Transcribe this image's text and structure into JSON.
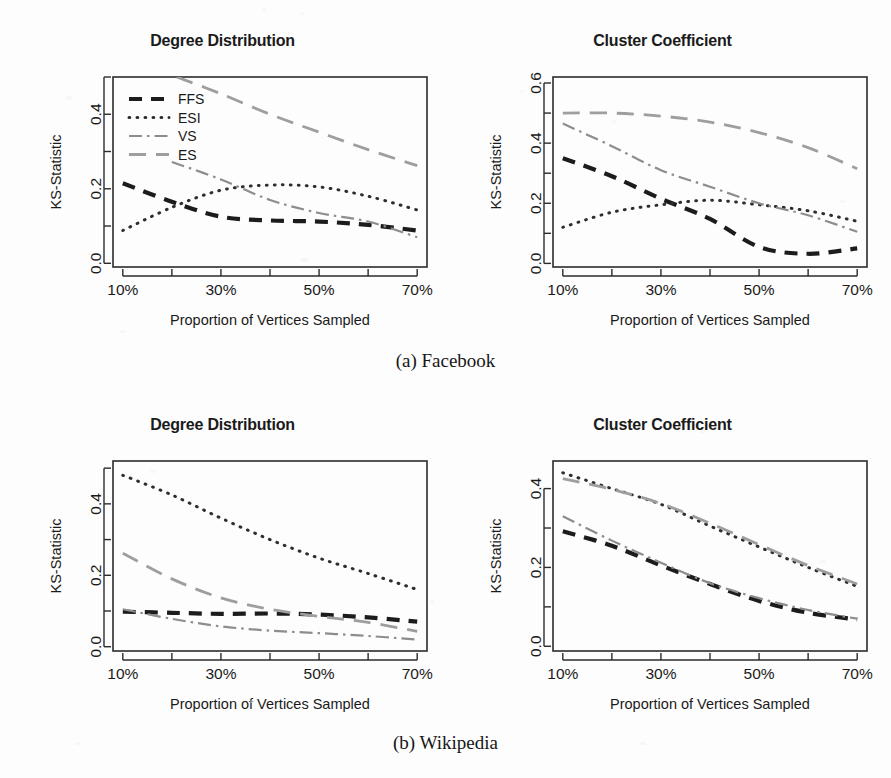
{
  "figure": {
    "captions": [
      {
        "id": "a",
        "text": "(a) Facebook"
      },
      {
        "id": "b",
        "text": "(b) Wikipedia"
      }
    ],
    "axis_title_x": "Proportion of Vertices Sampled",
    "axis_title_y": "KS-Statistic",
    "legend": {
      "entries": [
        {
          "label": "FFS",
          "style": "thick-dash",
          "color": "#1c1c1c"
        },
        {
          "label": "ESI",
          "style": "dotted",
          "color": "#2e2e2e"
        },
        {
          "label": "VS",
          "style": "dash-dot",
          "color": "#8d8d8d"
        },
        {
          "label": "ES",
          "style": "long-dash",
          "color": "#9e9e9e"
        }
      ]
    },
    "colors": {
      "ffs": "#1c1c1c",
      "esi": "#2e2e2e",
      "vs": "#8d8d8d",
      "es": "#9e9e9e",
      "frame": "#2b2b2b",
      "background": "#fdfdfd"
    }
  },
  "chart_data": [
    {
      "id": "facebook-degree-distribution",
      "type": "line",
      "title": "Degree Distribution",
      "dataset": "Facebook",
      "xlabel": "Proportion of Vertices Sampled",
      "ylabel": "KS-Statistic",
      "x": [
        10,
        20,
        30,
        40,
        50,
        60,
        70
      ],
      "xlim": [
        8,
        72
      ],
      "xticks": [
        10,
        20,
        30,
        40,
        50,
        60,
        70
      ],
      "xticklabels": [
        "10%",
        "",
        "30%",
        "",
        "50%",
        "",
        "70%"
      ],
      "ylim": [
        -0.01,
        0.5
      ],
      "yticks": [
        0.0,
        0.1,
        0.2,
        0.3,
        0.4,
        0.5
      ],
      "yticklabels": [
        "0.0",
        "",
        "0.2",
        "",
        "0.4",
        ""
      ],
      "grid": false,
      "legend_position": "top-left",
      "has_legend": true,
      "series": [
        {
          "name": "FFS",
          "style": "thick-dash",
          "color": "#1c1c1c",
          "x": [
            10,
            20,
            30,
            40,
            50,
            60,
            70
          ],
          "values": [
            0.215,
            0.165,
            0.125,
            0.115,
            0.112,
            0.103,
            0.088
          ]
        },
        {
          "name": "ESI",
          "style": "dotted",
          "color": "#2e2e2e",
          "x": [
            10,
            20,
            30,
            40,
            50,
            60,
            70
          ],
          "values": [
            0.088,
            0.15,
            0.196,
            0.21,
            0.205,
            0.18,
            0.143
          ]
        },
        {
          "name": "VS",
          "style": "dash-dot",
          "color": "#8d8d8d",
          "x": [
            20,
            30,
            40,
            50,
            60,
            70
          ],
          "values": [
            0.272,
            0.225,
            0.17,
            0.135,
            0.112,
            0.07
          ]
        },
        {
          "name": "ES",
          "style": "long-dash",
          "color": "#9e9e9e",
          "x": [
            21,
            30,
            40,
            50,
            60,
            70
          ],
          "values": [
            0.5,
            0.455,
            0.4,
            0.352,
            0.305,
            0.262
          ]
        }
      ]
    },
    {
      "id": "facebook-cluster-coefficient",
      "type": "line",
      "title": "Cluster Coefficient",
      "dataset": "Facebook",
      "xlabel": "Proportion of Vertices Sampled",
      "ylabel": "KS-Statistic",
      "x": [
        10,
        20,
        30,
        40,
        50,
        60,
        70
      ],
      "xlim": [
        8,
        72
      ],
      "xticks": [
        10,
        20,
        30,
        40,
        50,
        60,
        70
      ],
      "xticklabels": [
        "10%",
        "",
        "30%",
        "",
        "50%",
        "",
        "70%"
      ],
      "ylim": [
        -0.012,
        0.62
      ],
      "yticks": [
        0.0,
        0.1,
        0.2,
        0.3,
        0.4,
        0.5,
        0.6
      ],
      "yticklabels": [
        "0.0",
        "",
        "0.2",
        "",
        "0.4",
        "",
        "0.6"
      ],
      "grid": false,
      "legend_position": "none",
      "has_legend": false,
      "series": [
        {
          "name": "FFS",
          "style": "thick-dash",
          "color": "#1c1c1c",
          "x": [
            10,
            20,
            30,
            40,
            50,
            60,
            70
          ],
          "values": [
            0.35,
            0.29,
            0.215,
            0.148,
            0.055,
            0.032,
            0.05
          ]
        },
        {
          "name": "ESI",
          "style": "dotted",
          "color": "#2e2e2e",
          "x": [
            10,
            20,
            30,
            40,
            50,
            60,
            70
          ],
          "values": [
            0.12,
            0.17,
            0.195,
            0.21,
            0.195,
            0.175,
            0.14
          ]
        },
        {
          "name": "VS",
          "style": "dash-dot",
          "color": "#8d8d8d",
          "x": [
            10,
            20,
            30,
            40,
            50,
            60,
            70
          ],
          "values": [
            0.465,
            0.39,
            0.31,
            0.255,
            0.2,
            0.16,
            0.105
          ]
        },
        {
          "name": "ES",
          "style": "long-dash",
          "color": "#9e9e9e",
          "x": [
            10,
            20,
            30,
            40,
            50,
            60,
            70
          ],
          "values": [
            0.5,
            0.5,
            0.49,
            0.47,
            0.435,
            0.385,
            0.315
          ]
        }
      ]
    },
    {
      "id": "wikipedia-degree-distribution",
      "type": "line",
      "title": "Degree Distribution",
      "dataset": "Wikipedia",
      "xlabel": "Proportion of Vertices Sampled",
      "ylabel": "KS-Statistic",
      "x": [
        10,
        20,
        30,
        40,
        50,
        60,
        70
      ],
      "xlim": [
        8,
        72
      ],
      "xticks": [
        10,
        20,
        30,
        40,
        50,
        60,
        70
      ],
      "xticklabels": [
        "10%",
        "",
        "30%",
        "",
        "50%",
        "",
        "70%"
      ],
      "ylim": [
        -0.012,
        0.52
      ],
      "yticks": [
        0.0,
        0.1,
        0.2,
        0.3,
        0.4,
        0.5
      ],
      "yticklabels": [
        "0.0",
        "",
        "0.2",
        "",
        "0.4",
        ""
      ],
      "grid": false,
      "legend_position": "none",
      "has_legend": false,
      "series": [
        {
          "name": "FFS",
          "style": "thick-dash",
          "color": "#1c1c1c",
          "x": [
            10,
            20,
            30,
            40,
            50,
            60,
            70
          ],
          "values": [
            0.098,
            0.095,
            0.092,
            0.093,
            0.09,
            0.082,
            0.07
          ]
        },
        {
          "name": "ESI",
          "style": "dotted",
          "color": "#2e2e2e",
          "x": [
            10,
            20,
            30,
            40,
            50,
            60,
            70
          ],
          "values": [
            0.48,
            0.425,
            0.36,
            0.3,
            0.248,
            0.205,
            0.16
          ]
        },
        {
          "name": "VS",
          "style": "dash-dot",
          "color": "#8d8d8d",
          "x": [
            10,
            20,
            30,
            40,
            50,
            60,
            70
          ],
          "values": [
            0.105,
            0.078,
            0.057,
            0.045,
            0.038,
            0.03,
            0.02
          ]
        },
        {
          "name": "ES",
          "style": "long-dash",
          "color": "#9e9e9e",
          "x": [
            10,
            20,
            30,
            40,
            50,
            60,
            70
          ],
          "values": [
            0.262,
            0.19,
            0.137,
            0.105,
            0.085,
            0.068,
            0.043
          ]
        }
      ]
    },
    {
      "id": "wikipedia-cluster-coefficient",
      "type": "line",
      "title": "Cluster Coefficient",
      "dataset": "Wikipedia",
      "xlabel": "Proportion of Vertices Sampled",
      "ylabel": "KS-Statistic",
      "x": [
        10,
        20,
        30,
        40,
        50,
        60,
        70
      ],
      "xlim": [
        8,
        72
      ],
      "xticks": [
        10,
        20,
        30,
        40,
        50,
        60,
        70
      ],
      "xticklabels": [
        "10%",
        "",
        "30%",
        "",
        "50%",
        "",
        "70%"
      ],
      "ylim": [
        -0.012,
        0.47
      ],
      "yticks": [
        0.0,
        0.1,
        0.2,
        0.3,
        0.4
      ],
      "yticklabels": [
        "0.0",
        "",
        "0.2",
        "",
        "0.4"
      ],
      "grid": false,
      "legend_position": "none",
      "has_legend": false,
      "series": [
        {
          "name": "FFS",
          "style": "thick-dash",
          "color": "#1c1c1c",
          "x": [
            10,
            20,
            30,
            40,
            50,
            60,
            70
          ],
          "values": [
            0.292,
            0.255,
            0.205,
            0.158,
            0.115,
            0.085,
            0.068
          ]
        },
        {
          "name": "ESI",
          "style": "dotted",
          "color": "#2e2e2e",
          "x": [
            10,
            20,
            30,
            40,
            50,
            60,
            70
          ],
          "values": [
            0.44,
            0.4,
            0.36,
            0.305,
            0.252,
            0.2,
            0.152
          ]
        },
        {
          "name": "VS",
          "style": "dash-dot",
          "color": "#8d8d8d",
          "x": [
            10,
            20,
            30,
            40,
            50,
            60,
            70
          ],
          "values": [
            0.33,
            0.268,
            0.212,
            0.16,
            0.122,
            0.092,
            0.07
          ]
        },
        {
          "name": "ES",
          "style": "long-dash",
          "color": "#9e9e9e",
          "x": [
            10,
            20,
            30,
            40,
            50,
            60,
            70
          ],
          "values": [
            0.425,
            0.398,
            0.362,
            0.312,
            0.258,
            0.205,
            0.158
          ]
        }
      ]
    }
  ]
}
